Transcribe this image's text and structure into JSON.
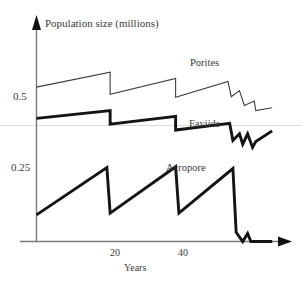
{
  "chart_data": {
    "type": "line",
    "title": "",
    "xlabel": "Years",
    "ylabel": "Population size (millions)",
    "xlim": [
      0,
      75
    ],
    "ylim": [
      0,
      0.72
    ],
    "xticks": [
      20,
      40
    ],
    "xtick_labels": [
      "20",
      "40"
    ],
    "yticks": [
      0.25,
      0.5
    ],
    "ytick_labels": [
      "0.25",
      "0.5"
    ],
    "grid": "single faint horizontal gridline near y=0.42",
    "legend": "inline series labels on plot",
    "annotations": [
      "Porites",
      "Faviids",
      "Acropore"
    ],
    "series": [
      {
        "name": "Porites",
        "style": "thin",
        "points": [
          [
            0,
            0.533
          ],
          [
            22.5,
            0.585
          ],
          [
            22.5,
            0.508
          ],
          [
            42.5,
            0.563
          ],
          [
            42.5,
            0.498
          ],
          [
            58.5,
            0.553
          ],
          [
            59.5,
            0.5
          ],
          [
            62,
            0.521
          ],
          [
            63.5,
            0.47
          ],
          [
            66.5,
            0.485
          ],
          [
            67,
            0.452
          ],
          [
            72,
            0.462
          ]
        ]
      },
      {
        "name": "Faviids",
        "style": "thick",
        "points": [
          [
            0,
            0.425
          ],
          [
            22.5,
            0.452
          ],
          [
            22.5,
            0.405
          ],
          [
            42.5,
            0.432
          ],
          [
            42.5,
            0.385
          ],
          [
            59,
            0.408
          ],
          [
            60,
            0.349
          ],
          [
            62,
            0.372
          ],
          [
            63,
            0.336
          ],
          [
            64.5,
            0.372
          ],
          [
            66,
            0.325
          ],
          [
            67,
            0.345
          ],
          [
            72,
            0.382
          ]
        ]
      },
      {
        "name": "Acropore",
        "style": "thick",
        "points": [
          [
            0,
            0.092
          ],
          [
            21.5,
            0.255
          ],
          [
            22.5,
            0.098
          ],
          [
            42.5,
            0.258
          ],
          [
            43.5,
            0.098
          ],
          [
            60,
            0.252
          ],
          [
            61,
            0.032
          ],
          [
            63,
            0.0
          ],
          [
            64.5,
            0.028
          ],
          [
            65.5,
            0.0
          ],
          [
            72,
            0.0
          ]
        ]
      }
    ]
  },
  "axes": {
    "y_title": "Population size (millions)",
    "x_title": "Years",
    "y_ticks": [
      "0.5",
      "0.25"
    ],
    "x_ticks": [
      "20",
      "40"
    ]
  },
  "colors": {
    "line": "#1a1a1a",
    "thin_line": "#3d3d3d",
    "axis": "#6e6e6e",
    "gridline": "#d9d9d9",
    "text": "#3a3a3a",
    "background": "#ffffff"
  }
}
